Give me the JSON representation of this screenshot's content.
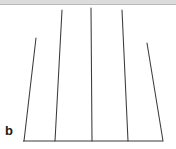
{
  "figure": {
    "panel_label": "b",
    "background_color": "#ffffff",
    "line_color": "#3a3a3a",
    "top_band_color": "#dcdcdc"
  },
  "chart_data": {
    "type": "line",
    "title": "",
    "subtitle": "",
    "xlabel": "",
    "ylabel": "",
    "annotations": [
      "b"
    ],
    "grid": false,
    "legend": null,
    "axis": {
      "baseline_y": 141,
      "baseline_x_start": 23,
      "baseline_x_end": 163,
      "xlim": [
        23,
        163
      ],
      "ylim": [
        141,
        8
      ]
    },
    "xtick_labels": [],
    "ytick_labels": [],
    "series": [
      {
        "name": "peak-1",
        "x_base": 24,
        "x_top": 36,
        "y_base": 141,
        "y_top": 38,
        "height": 103
      },
      {
        "name": "peak-2",
        "x_base": 55,
        "x_top": 62,
        "y_base": 141,
        "y_top": 10,
        "height": 131
      },
      {
        "name": "peak-3",
        "x_base": 92,
        "x_top": 91,
        "y_base": 141,
        "y_top": 8,
        "height": 133
      },
      {
        "name": "peak-4",
        "x_base": 128,
        "x_top": 122,
        "y_base": 141,
        "y_top": 10,
        "height": 131
      },
      {
        "name": "peak-5",
        "x_base": 163,
        "x_top": 147,
        "y_base": 141,
        "y_top": 43,
        "height": 98
      }
    ]
  }
}
